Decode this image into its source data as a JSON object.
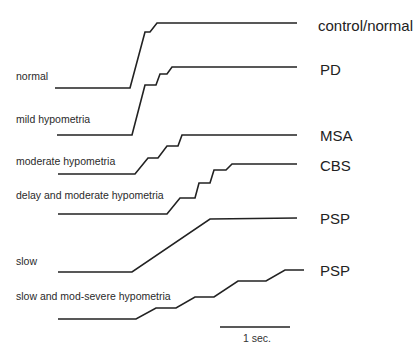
{
  "diagram": {
    "type": "eye-movement-traces",
    "line_color": "#222222",
    "traces": [
      {
        "left_label": "normal",
        "right_label": "control/normal",
        "points": "55,88 130,88 145,32 150,32 157,23 297,23"
      },
      {
        "left_label": "mild hypometria",
        "right_label": "PD",
        "points": "57,135 132,135 145,85 156,85 160,74 167,74 172,67 297,67"
      },
      {
        "left_label": "moderate hypometria",
        "right_label": "MSA",
        "points": "58,174 135,174 148,158 158,158 167,146 178,146 182,135 297,135"
      },
      {
        "left_label": "delay and moderate hypometria",
        "right_label": "CBS",
        "points": "58,214 167,214 180,198 195,198 199,183 210,183 214,170 226,170 232,164 297,164"
      },
      {
        "left_label": "slow",
        "right_label": "PSP",
        "points": "58,272 132,272 210,219 297,218"
      },
      {
        "left_label": "slow and mod-severe hypometria",
        "right_label": "PSP",
        "points": "58,319 136,319 156,308 176,308 195,297 214,297 238,281 266,281 285,270 304,270"
      }
    ],
    "scale_bar": {
      "label": "1 sec.",
      "x1": 220,
      "x2": 290,
      "y": 327
    }
  }
}
